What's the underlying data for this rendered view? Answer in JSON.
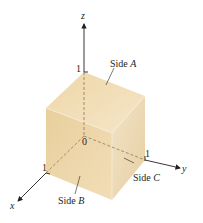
{
  "figure": {
    "type": "unit-cube-3d-axes",
    "axes": {
      "x": {
        "label": "x",
        "tick": "1"
      },
      "y": {
        "label": "y",
        "tick": "1"
      },
      "z": {
        "label": "z",
        "tick": "1"
      }
    },
    "origin_label": "0",
    "sides": [
      {
        "name": "Side",
        "letter": "A"
      },
      {
        "name": "Side",
        "letter": "B"
      },
      {
        "name": "Side",
        "letter": "C"
      }
    ],
    "colors": {
      "top_face": "#f0dcb4",
      "left_face": "#ecd4a4",
      "right_face": "#e9d2a6",
      "axis": "#231f20",
      "hidden_edge": "#9a8660"
    }
  }
}
